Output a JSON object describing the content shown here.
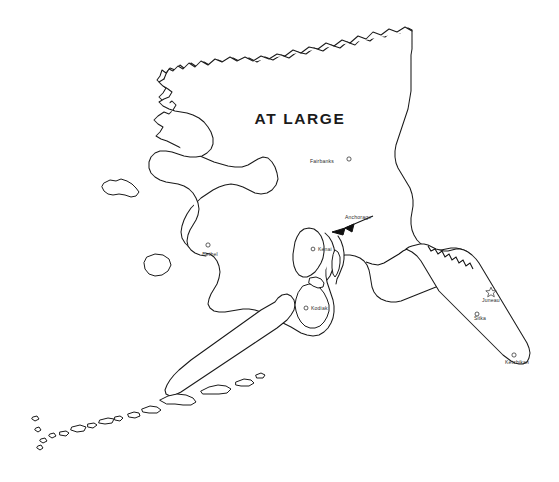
{
  "map": {
    "title": "AT LARGE",
    "state": "Alaska",
    "style": {
      "background": "#ffffff",
      "outline_color": "#1a1a1a",
      "label_color": "#2b2b2b"
    },
    "cities": [
      {
        "name": "Fairbanks",
        "marker": "circle-icon",
        "label_x": 310,
        "label_y": 163,
        "marker_x": 349,
        "marker_y": 159,
        "anchor": "start"
      },
      {
        "name": "Anchorage",
        "marker": "leader-arrow-icon",
        "label_x": 345,
        "label_y": 219,
        "marker_x": 333,
        "marker_y": 233,
        "anchor": "start"
      },
      {
        "name": "Kenai",
        "marker": "circle-icon",
        "label_x": 318,
        "label_y": 251,
        "marker_x": 313,
        "marker_y": 249,
        "anchor": "start"
      },
      {
        "name": "Bethel",
        "marker": "circle-icon",
        "label_x": 210,
        "label_y": 256,
        "marker_x": 208,
        "marker_y": 245,
        "anchor": "middle"
      },
      {
        "name": "Kodiak",
        "marker": "circle-icon",
        "label_x": 311,
        "label_y": 310,
        "marker_x": 306,
        "marker_y": 308,
        "anchor": "start"
      },
      {
        "name": "Juneau",
        "marker": "star-icon",
        "label_x": 491,
        "label_y": 302,
        "marker_x": 491,
        "marker_y": 292,
        "anchor": "middle"
      },
      {
        "name": "Sitka",
        "marker": "circle-icon",
        "label_x": 480,
        "label_y": 320,
        "marker_x": 477,
        "marker_y": 314,
        "anchor": "middle"
      },
      {
        "name": "Ketchikan",
        "marker": "circle-icon",
        "label_x": 517,
        "label_y": 364,
        "marker_x": 514,
        "marker_y": 355,
        "anchor": "middle"
      }
    ],
    "title_x": 300,
    "title_y": 124
  }
}
